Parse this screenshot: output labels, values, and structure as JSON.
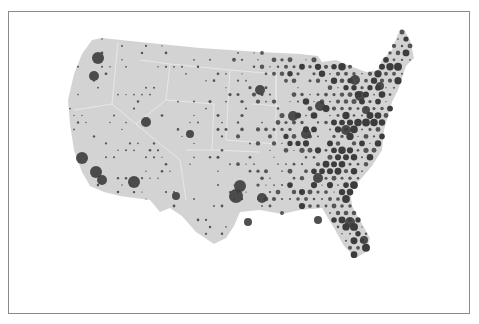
{
  "map": {
    "type": "dot-density map",
    "region": "Contiguous United States",
    "colors": {
      "land": "#d3d3d3",
      "state_border": "#ececec",
      "dot": "#555555",
      "dot_dark": "#3c3c3c",
      "frame": "#8a8a8a",
      "background": "#ffffff"
    },
    "outline": "M92,40 L102,38 L140,42 L200,48 L260,52 L300,54 L318,56 L322,62 L336,60 L350,66 L366,72 L378,70 L382,60 L392,50 L398,34 L404,30 L410,40 L414,58 L406,66 L402,78 L398,90 L392,102 L388,116 L384,130 L382,150 L372,166 L360,180 L350,190 L352,206 L362,224 L370,238 L366,252 L356,258 L344,246 L334,228 L322,208 L300,210 L282,214 L260,210 L240,212 L234,226 L226,238 L214,244 L196,232 L182,216 L170,208 L160,212 L150,200 L120,196 L104,192 L90,186 L82,172 L74,150 L70,124 L68,100 L74,74 L82,54 Z",
    "state_lines": [
      "M118,42 L112,104 L136,124",
      "M74,110 L112,104",
      "M136,124 L180,160 L186,200",
      "M140,60 L170,64 L166,100 L136,124",
      "M166,100 L214,104",
      "M170,64 L230,70 L228,104",
      "M214,104 L212,150 L186,150",
      "M228,104 L226,140 L276,144",
      "M212,150 L260,152",
      "M230,70 L276,74 L276,144",
      "M276,74 L276,100",
      "M252,104 L280,106"
    ],
    "dot_grid": {
      "spacing": 8,
      "seed": 7
    },
    "hotspots": [
      {
        "x": 98,
        "y": 58,
        "r": 6,
        "label": "seattle"
      },
      {
        "x": 94,
        "y": 76,
        "r": 5
      },
      {
        "x": 82,
        "y": 158,
        "r": 6
      },
      {
        "x": 96,
        "y": 172,
        "r": 6
      },
      {
        "x": 102,
        "y": 180,
        "r": 5
      },
      {
        "x": 134,
        "y": 182,
        "r": 6
      },
      {
        "x": 146,
        "y": 122,
        "r": 5
      },
      {
        "x": 176,
        "y": 196,
        "r": 4
      },
      {
        "x": 190,
        "y": 134,
        "r": 4
      },
      {
        "x": 236,
        "y": 196,
        "r": 7
      },
      {
        "x": 240,
        "y": 186,
        "r": 6
      },
      {
        "x": 248,
        "y": 222,
        "r": 4
      },
      {
        "x": 262,
        "y": 198,
        "r": 5
      },
      {
        "x": 260,
        "y": 90,
        "r": 5
      },
      {
        "x": 293,
        "y": 116,
        "r": 5
      },
      {
        "x": 306,
        "y": 134,
        "r": 5
      },
      {
        "x": 320,
        "y": 106,
        "r": 5
      },
      {
        "x": 346,
        "y": 130,
        "r": 5
      },
      {
        "x": 355,
        "y": 80,
        "r": 5
      },
      {
        "x": 360,
        "y": 96,
        "r": 5
      },
      {
        "x": 366,
        "y": 110,
        "r": 4
      },
      {
        "x": 380,
        "y": 86,
        "r": 4
      },
      {
        "x": 350,
        "y": 222,
        "r": 5
      },
      {
        "x": 364,
        "y": 240,
        "r": 4
      },
      {
        "x": 318,
        "y": 220,
        "r": 4
      },
      {
        "x": 318,
        "y": 178,
        "r": 5
      }
    ]
  }
}
